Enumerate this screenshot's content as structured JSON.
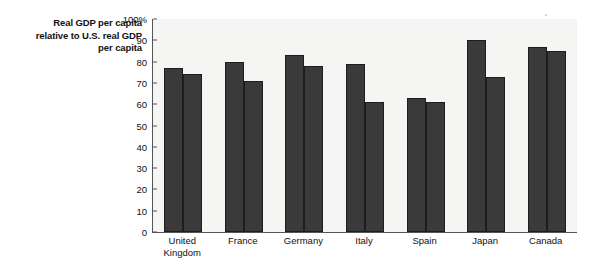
{
  "chart_data": {
    "type": "bar",
    "title": "Real GDP per capita relative to U.S. real GDP per capita",
    "title_lines": [
      "Real GDP per capita",
      "relative to U.S. real GDP",
      "per capita"
    ],
    "xlabel": "",
    "ylabel": "",
    "ylim": [
      0,
      100
    ],
    "ytick_values": [
      100,
      90,
      80,
      70,
      60,
      50,
      40,
      30,
      20,
      10,
      0
    ],
    "ytick_labels": [
      "100%",
      "90",
      "80",
      "70",
      "60",
      "50",
      "40",
      "30",
      "20",
      "10",
      "0"
    ],
    "grid": false,
    "legend_position": "top-left-inside",
    "categories": [
      "United Kingdom",
      "France",
      "Germany",
      "Italy",
      "Spain",
      "Japan",
      "Canada"
    ],
    "category_lines": [
      [
        "United",
        "Kingdom"
      ],
      [
        "France"
      ],
      [
        "Germany"
      ],
      [
        "Italy"
      ],
      [
        "Spain"
      ],
      [
        "Japan"
      ],
      [
        "Canada"
      ]
    ],
    "series": [
      {
        "name": "1990",
        "color": "#3a3a3a",
        "values": [
          77,
          80,
          83,
          79,
          63,
          90,
          87
        ]
      },
      {
        "name": "2012",
        "color": "#3a3a3a",
        "values": [
          74,
          71,
          78,
          61,
          61,
          73,
          85
        ]
      }
    ]
  },
  "colors": {
    "bar": "#3a3a3a",
    "bar_edge": "#1d1d1d",
    "axis": "#555555",
    "plot_background": "#f5f5f3",
    "page_background": "#ffffff",
    "text": "#111111"
  }
}
